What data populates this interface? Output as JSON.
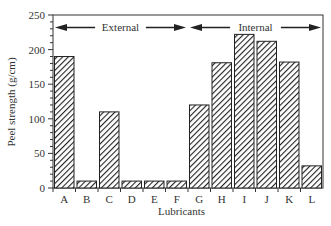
{
  "chart_data": {
    "type": "bar",
    "title": "",
    "xlabel": "Lubricants",
    "ylabel": "Peel strength  (g/cm)",
    "categories": [
      "A",
      "B",
      "C",
      "D",
      "E",
      "F",
      "G",
      "H",
      "I",
      "J",
      "K",
      "L"
    ],
    "values": [
      190,
      10,
      110,
      10,
      10,
      10,
      120,
      181,
      222,
      212,
      182,
      32
    ],
    "ylim": [
      0,
      250
    ],
    "yticks": [
      0,
      50,
      100,
      150,
      200,
      250
    ],
    "grid": false,
    "legend": null,
    "bar_fill": "diagonal hatch",
    "annotations": [
      {
        "text": "External",
        "span": [
          "A",
          "F"
        ],
        "arrow": "double-headed",
        "y_value": 232
      },
      {
        "text": "Internal",
        "span": [
          "G",
          "L"
        ],
        "arrow": "double-headed",
        "y_value": 232
      }
    ]
  },
  "labels": {
    "xlabel": "Lubricants",
    "ylabel": "Peel strength  (g/cm)",
    "external": "External",
    "internal": "Internal"
  }
}
